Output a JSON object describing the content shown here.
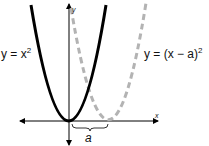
{
  "diagram": {
    "curves": [
      {
        "name": "base-parabola",
        "equation_label": "y = x²",
        "label_main": "y = x",
        "label_sup": "2",
        "style": "solid",
        "color": "#000000"
      },
      {
        "name": "shifted-parabola",
        "equation_label": "y = (x − a)²",
        "label_main": "y = (x − a)",
        "label_sup": "2",
        "style": "dashed",
        "color": "#b3b3b3"
      }
    ],
    "axes": {
      "x_label": "x",
      "y_label": "y"
    },
    "shift_label": "a"
  }
}
